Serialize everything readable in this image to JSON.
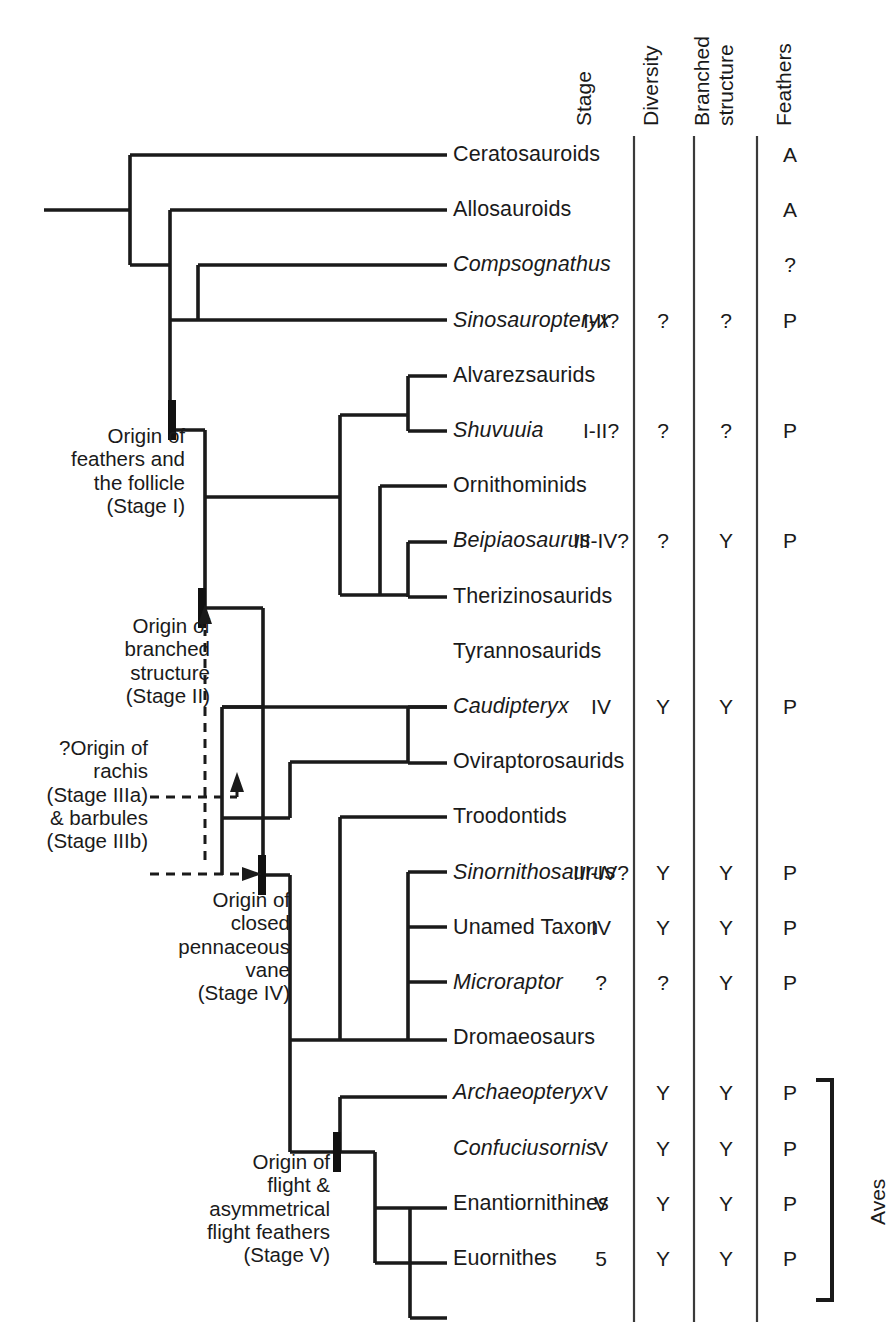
{
  "figure": {
    "kind": "phylogenetic-cladogram",
    "line_color": "#1a1a1a",
    "background": "#ffffff"
  },
  "columns": {
    "headers": [
      {
        "key": "stage",
        "label": "Stage",
        "x": 565,
        "rotated": true
      },
      {
        "key": "diversity",
        "label": "Diversity",
        "x": 632,
        "rotated": true
      },
      {
        "key": "branched",
        "label": "Branched structure",
        "label_line1": "Branched",
        "label_line2": "structure",
        "x": 697,
        "rotated": true
      },
      {
        "key": "feathers",
        "label": "Feathers",
        "x": 765,
        "rotated": true
      }
    ],
    "value_x": {
      "stage": 601,
      "diversity": 663,
      "branched": 726,
      "feathers": 790
    },
    "rule_x": [
      634,
      694,
      757
    ],
    "rule_top": 136,
    "rule_bottom": 1320
  },
  "rows": [
    {
      "taxon": "Ceratosauroids",
      "italic": false,
      "stage": "",
      "diversity": "",
      "branched": "",
      "feathers": "A"
    },
    {
      "taxon": "Allosauroids",
      "italic": false,
      "stage": "",
      "diversity": "",
      "branched": "",
      "feathers": "A"
    },
    {
      "taxon": "Compsognathus",
      "italic": true,
      "stage": "",
      "diversity": "",
      "branched": "",
      "feathers": "?"
    },
    {
      "taxon": "Sinosauropteryx",
      "italic": true,
      "stage": "I-II?",
      "diversity": "?",
      "branched": "?",
      "feathers": "P"
    },
    {
      "taxon": "Alvarezsaurids",
      "italic": false,
      "stage": "",
      "diversity": "",
      "branched": "",
      "feathers": ""
    },
    {
      "taxon": "Shuvuuia",
      "italic": true,
      "stage": "I-II?",
      "diversity": "?",
      "branched": "?",
      "feathers": "P"
    },
    {
      "taxon": "Ornithominids",
      "italic": false,
      "stage": "",
      "diversity": "",
      "branched": "",
      "feathers": ""
    },
    {
      "taxon": "Beipiaosaurus",
      "italic": true,
      "stage": "III-IV?",
      "diversity": "?",
      "branched": "Y",
      "feathers": "P"
    },
    {
      "taxon": "Therizinosaurids",
      "italic": false,
      "stage": "",
      "diversity": "",
      "branched": "",
      "feathers": ""
    },
    {
      "taxon": "Tyrannosaurids",
      "italic": false,
      "stage": "",
      "diversity": "",
      "branched": "",
      "feathers": ""
    },
    {
      "taxon": "Caudipteryx",
      "italic": true,
      "stage": "IV",
      "diversity": "Y",
      "branched": "Y",
      "feathers": "P"
    },
    {
      "taxon": "Oviraptorosaurids",
      "italic": false,
      "stage": "",
      "diversity": "",
      "branched": "",
      "feathers": ""
    },
    {
      "taxon": "Troodontids",
      "italic": false,
      "stage": "",
      "diversity": "",
      "branched": "",
      "feathers": ""
    },
    {
      "taxon": "Sinornithosaurus",
      "italic": true,
      "stage": "III-IV?",
      "diversity": "Y",
      "branched": "Y",
      "feathers": "P"
    },
    {
      "taxon": "Unamed Taxon",
      "italic": false,
      "stage": "IV",
      "diversity": "Y",
      "branched": "Y",
      "feathers": "P"
    },
    {
      "taxon": "Microraptor",
      "italic": true,
      "stage": "?",
      "diversity": "?",
      "branched": "Y",
      "feathers": "P"
    },
    {
      "taxon": "Dromaeosaurs",
      "italic": false,
      "stage": "",
      "diversity": "",
      "branched": "",
      "feathers": ""
    },
    {
      "taxon": "Archaeopteryx",
      "italic": true,
      "stage": "V",
      "diversity": "Y",
      "branched": "Y",
      "feathers": "P"
    },
    {
      "taxon": "Confuciusornis",
      "italic": true,
      "stage": "V",
      "diversity": "Y",
      "branched": "Y",
      "feathers": "P"
    },
    {
      "taxon": "Enantiornithines",
      "italic": false,
      "stage": "V",
      "diversity": "Y",
      "branched": "Y",
      "feathers": "P"
    },
    {
      "taxon": "Euornithes",
      "italic": false,
      "stage": "5",
      "diversity": "Y",
      "branched": "Y",
      "feathers": "P"
    }
  ],
  "row_geometry": {
    "first_y": 155,
    "step": 55.2,
    "tip_x": 447
  },
  "annotations": [
    {
      "id": "stage-1",
      "text": "Origin of\nfeathers and\nthe follicle\n(Stage I)",
      "x": 185,
      "y": 428,
      "align": "right"
    },
    {
      "id": "stage-2",
      "text": "Origin of\nbranched\nstructure\n(Stage II)",
      "x": 210,
      "y": 618,
      "align": "right"
    },
    {
      "id": "stage-3",
      "text": "?Origin of\nrachis\n(Stage IIIa)\n& barbules\n(Stage IIIb)",
      "x": 148,
      "y": 768,
      "align": "right"
    },
    {
      "id": "stage-4",
      "text": "Origin of\nclosed\npennaceous\nvane\n(Stage IV)",
      "x": 290,
      "y": 892,
      "align": "right"
    },
    {
      "id": "stage-5",
      "text": "Origin of\nflight &\nasymmetrical\nflight feathers\n(Stage V)",
      "x": 330,
      "y": 1155,
      "align": "right"
    }
  ],
  "clade_bracket": {
    "label": "Aves",
    "x": 830,
    "top": 1108,
    "bottom": 1300,
    "tick": 14
  },
  "tree": {
    "root_stub": {
      "x1": 44,
      "x2": 130,
      "y": 210
    },
    "nodes": [
      {
        "id": "n-root",
        "x": 130,
        "y_from": 155,
        "y_to": 265
      },
      {
        "id": "n-tetanur",
        "x": 170,
        "y_from": 210,
        "y_to": 430
      },
      {
        "id": "n-coelur",
        "x": 198,
        "y_from": 265,
        "y_to": 320
      },
      {
        "id": "n-maniraptoriform",
        "x": 205,
        "y_from": 430,
        "y_to": 608
      },
      {
        "id": "n-manA",
        "x": 250,
        "y_from": 497,
        "y_to": 608
      },
      {
        "id": "n-alvz-orn",
        "x": 340,
        "y_from": 415,
        "y_to": 595
      },
      {
        "id": "n-alvz",
        "x": 408,
        "y_from": 376,
        "y_to": 431
      },
      {
        "id": "n-ther-cl",
        "x": 380,
        "y_from": 486,
        "y_to": 595
      },
      {
        "id": "n-ther",
        "x": 408,
        "y_from": 542,
        "y_to": 597
      },
      {
        "id": "n-pennaraptora",
        "x": 263,
        "y_from": 608,
        "y_to": 875
      },
      {
        "id": "n-manB",
        "x": 222,
        "y_from": 707,
        "y_to": 875
      },
      {
        "id": "n-oviclade",
        "x": 290,
        "y_from": 762,
        "y_to": 818
      },
      {
        "id": "n-ovi",
        "x": 408,
        "y_from": 707,
        "y_to": 763
      },
      {
        "id": "n-paraves",
        "x": 290,
        "y_from": 875,
        "y_to": 1152
      },
      {
        "id": "n-deino",
        "x": 340,
        "y_from": 817,
        "y_to": 1040
      },
      {
        "id": "n-drom",
        "x": 408,
        "y_from": 872,
        "y_to": 1040
      },
      {
        "id": "n-aves",
        "x": 340,
        "y_from": 1097,
        "y_to": 1208
      },
      {
        "id": "n-aves2",
        "x": 375,
        "y_from": 1152,
        "y_to": 1263
      },
      {
        "id": "n-aves3",
        "x": 410,
        "y_from": 1208,
        "y_to": 1263
      }
    ],
    "tick_marks": [
      {
        "id": "tick-stage-1",
        "x": 172,
        "y": 419
      },
      {
        "id": "tick-stage-2",
        "x": 202,
        "y": 607
      },
      {
        "id": "tick-stage-4",
        "x": 262,
        "y": 874
      },
      {
        "id": "tick-stage-5",
        "x": 337,
        "y": 1151
      }
    ],
    "dashed_arrows": [
      {
        "id": "arrow-stage-2",
        "desc": "arrow pointing up to Stage II node"
      },
      {
        "id": "arrow-rachis",
        "desc": "dashed leader to oviraptorosaur node"
      },
      {
        "id": "arrow-stage-4",
        "desc": "dashed arrow to Stage IV node"
      }
    ]
  }
}
